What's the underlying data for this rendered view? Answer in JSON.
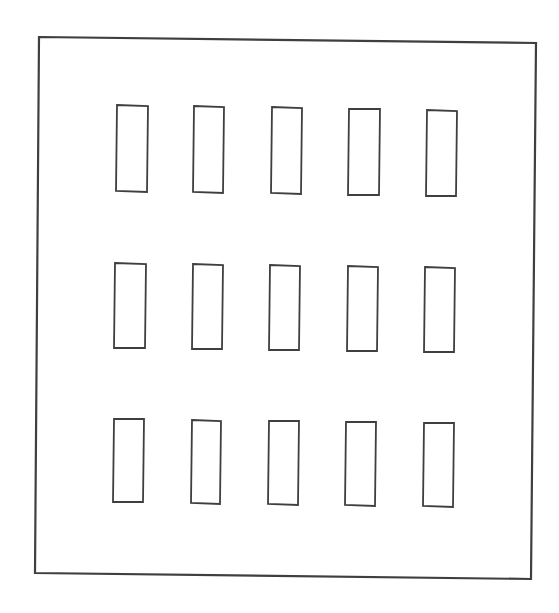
{
  "canvas": {
    "width": 559,
    "height": 613,
    "background": "#ffffff"
  },
  "style": {
    "stroke": "#3f3f3f",
    "outer_stroke_width": 2.2,
    "cell_stroke_width": 1.8
  },
  "diagram": {
    "type": "grid-layout-outline",
    "rows": 3,
    "columns": 5,
    "outer_border": {
      "points": [
        [
          39,
          37
        ],
        [
          536,
          43
        ],
        [
          531,
          579
        ],
        [
          35,
          573
        ]
      ]
    },
    "cells": [
      {
        "row": 1,
        "col": 1,
        "points": [
          [
            117,
            105
          ],
          [
            148,
            106
          ],
          [
            147,
            192
          ],
          [
            116,
            191
          ]
        ]
      },
      {
        "row": 1,
        "col": 2,
        "points": [
          [
            194,
            106
          ],
          [
            224,
            107
          ],
          [
            223,
            193
          ],
          [
            193,
            192
          ]
        ]
      },
      {
        "row": 1,
        "col": 3,
        "points": [
          [
            272,
            107
          ],
          [
            302,
            108
          ],
          [
            301,
            194
          ],
          [
            271,
            193
          ]
        ]
      },
      {
        "row": 1,
        "col": 4,
        "points": [
          [
            349,
            109
          ],
          [
            380,
            109
          ],
          [
            379,
            195
          ],
          [
            348,
            195
          ]
        ]
      },
      {
        "row": 1,
        "col": 5,
        "points": [
          [
            427,
            110
          ],
          [
            457,
            111
          ],
          [
            456,
            196
          ],
          [
            426,
            196
          ]
        ]
      },
      {
        "row": 2,
        "col": 1,
        "points": [
          [
            115,
            263
          ],
          [
            146,
            264
          ],
          [
            145,
            348
          ],
          [
            114,
            348
          ]
        ]
      },
      {
        "row": 2,
        "col": 2,
        "points": [
          [
            193,
            264
          ],
          [
            223,
            265
          ],
          [
            222,
            349
          ],
          [
            192,
            349
          ]
        ]
      },
      {
        "row": 2,
        "col": 3,
        "points": [
          [
            270,
            265
          ],
          [
            300,
            266
          ],
          [
            299,
            350
          ],
          [
            269,
            350
          ]
        ]
      },
      {
        "row": 2,
        "col": 4,
        "points": [
          [
            348,
            266
          ],
          [
            378,
            267
          ],
          [
            377,
            351
          ],
          [
            347,
            351
          ]
        ]
      },
      {
        "row": 2,
        "col": 5,
        "points": [
          [
            425,
            267
          ],
          [
            455,
            268
          ],
          [
            454,
            352
          ],
          [
            424,
            352
          ]
        ]
      },
      {
        "row": 3,
        "col": 1,
        "points": [
          [
            114,
            419
          ],
          [
            144,
            419
          ],
          [
            143,
            502
          ],
          [
            113,
            502
          ]
        ]
      },
      {
        "row": 3,
        "col": 2,
        "points": [
          [
            192,
            420
          ],
          [
            221,
            421
          ],
          [
            220,
            504
          ],
          [
            191,
            503
          ]
        ]
      },
      {
        "row": 3,
        "col": 3,
        "points": [
          [
            269,
            421
          ],
          [
            299,
            421
          ],
          [
            298,
            505
          ],
          [
            268,
            504
          ]
        ]
      },
      {
        "row": 3,
        "col": 4,
        "points": [
          [
            346,
            422
          ],
          [
            376,
            422
          ],
          [
            375,
            506
          ],
          [
            345,
            505
          ]
        ]
      },
      {
        "row": 3,
        "col": 5,
        "points": [
          [
            424,
            423
          ],
          [
            454,
            423
          ],
          [
            453,
            507
          ],
          [
            423,
            506
          ]
        ]
      }
    ]
  }
}
